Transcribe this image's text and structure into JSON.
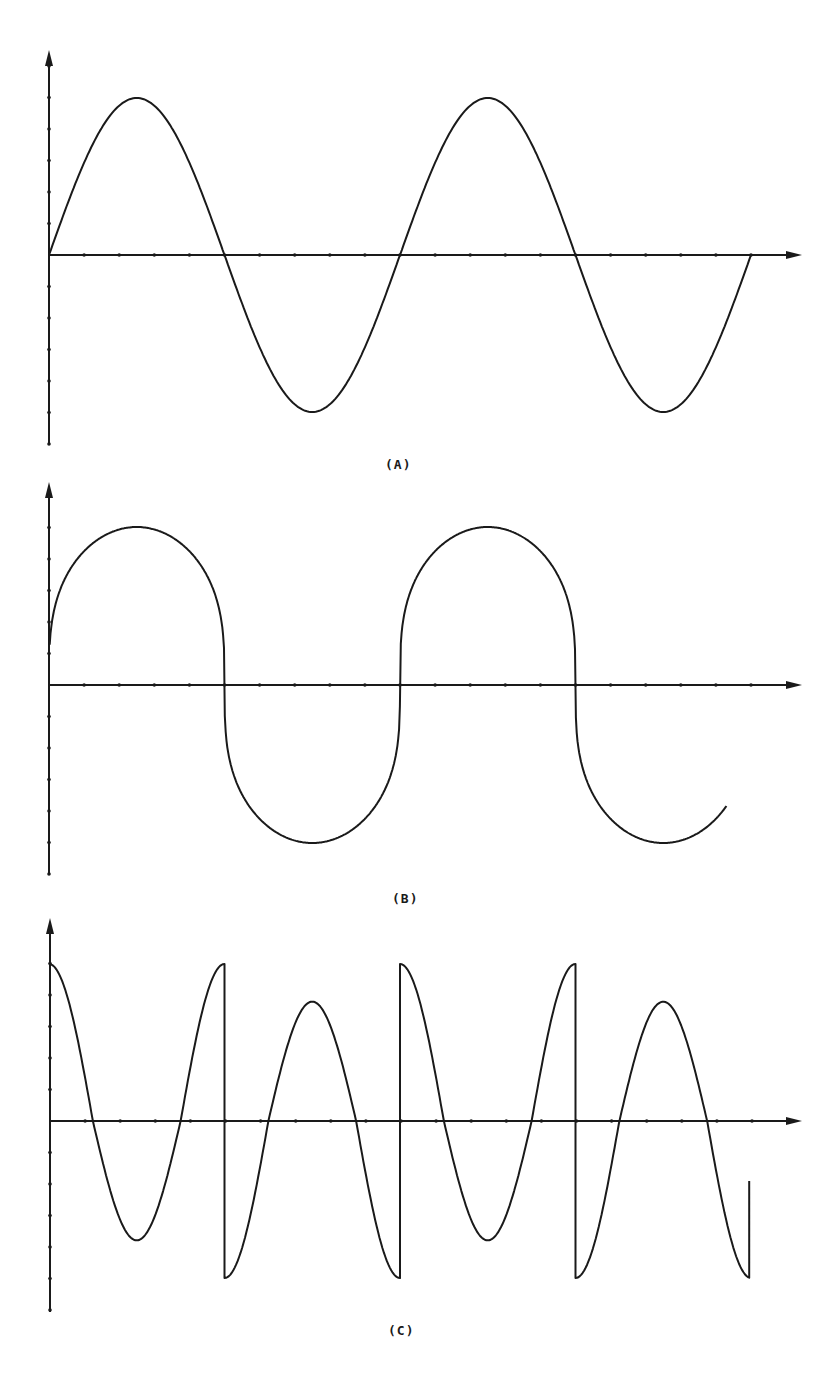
{
  "chart_data": [
    {
      "type": "line",
      "panel": "A",
      "title": "",
      "label": "(A)",
      "xlabel": "",
      "ylabel": "",
      "description": "Pure sinusoid, two full cycles",
      "x_ticks_count": 20,
      "y_ticks_count": 6,
      "grid": false,
      "x": [
        0,
        0.25,
        0.5,
        0.75,
        1.0,
        1.25,
        1.5,
        1.75,
        2.0
      ],
      "series": [
        {
          "name": "waveform A",
          "values": [
            0,
            1,
            0,
            -1,
            0,
            1,
            0,
            -1,
            0
          ]
        }
      ],
      "ylim": [
        -1.2,
        1.25
      ],
      "xlim": [
        0,
        2.1
      ]
    },
    {
      "type": "line",
      "panel": "B",
      "title": "",
      "label": "(B)",
      "xlabel": "",
      "ylabel": "",
      "description": "Rounded square-like wave (flattened tops, steep zero crossings), two cycles, ends mid-rise",
      "x_ticks_count": 20,
      "y_ticks_count": 6,
      "grid": false,
      "x": [
        0,
        0.05,
        0.25,
        0.45,
        0.5,
        0.55,
        0.75,
        0.95,
        1.0,
        1.05,
        1.25,
        1.45,
        1.5,
        1.55,
        1.75,
        1.93
      ],
      "series": [
        {
          "name": "waveform B",
          "values": [
            0.35,
            0.8,
            1,
            0.8,
            0,
            -0.8,
            -1,
            -0.8,
            0,
            0.8,
            1,
            0.8,
            0,
            -0.8,
            -1,
            -0.4
          ]
        }
      ],
      "ylim": [
        -1.2,
        1.25
      ],
      "xlim": [
        0,
        2.1
      ]
    },
    {
      "type": "line",
      "panel": "C",
      "title": "",
      "label": "(C)",
      "xlabel": "",
      "ylabel": "",
      "description": "Distorted wave with sharp positive spikes and vertical discontinuities at x=0.5 and x=1.5; alternating tall peaks (~1.0) and lower rounded peaks (~0.75)",
      "x_ticks_count": 20,
      "y_ticks_count": 6,
      "grid": false,
      "x": [
        0,
        0.11,
        0.25,
        0.39,
        0.5,
        0.5,
        0.61,
        0.75,
        0.89,
        1.0,
        1.0,
        1.11,
        1.25,
        1.39,
        1.5,
        1.5,
        1.61,
        1.75,
        1.89,
        1.94,
        1.94
      ],
      "series": [
        {
          "name": "waveform C",
          "values": [
            1.0,
            0,
            -0.75,
            0,
            1.0,
            -1.0,
            0,
            0.75,
            0,
            -1.0,
            1.0,
            0,
            -0.75,
            0,
            1.0,
            -1.0,
            0,
            0.75,
            0,
            -1.0,
            -0.5
          ]
        }
      ],
      "ylim": [
        -1.2,
        1.25
      ],
      "xlim": [
        0,
        2.1
      ]
    }
  ],
  "labels": {
    "a": "(A)",
    "b": "(B)",
    "c": "(C)"
  }
}
